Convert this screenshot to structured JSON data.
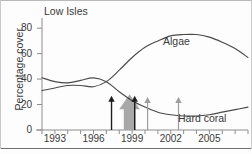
{
  "chart_data": {
    "type": "line",
    "title": "Low Isles",
    "xlabel": "",
    "ylabel": "Percentage cover",
    "xlim": [
      1992,
      2008
    ],
    "ylim": [
      0,
      88
    ],
    "grid": false,
    "legend_position": "inline-annotations",
    "xticks": [
      1993,
      1996,
      1999,
      2002,
      2005
    ],
    "xtick_labels": [
      "1993",
      "1996",
      "1999",
      "2002",
      "2005"
    ],
    "yticks": [
      0,
      20,
      40,
      60,
      80
    ],
    "ytick_labels": [
      "0",
      "20",
      "40",
      "60",
      "80"
    ],
    "series": [
      {
        "name": "Algae",
        "label": "Algae",
        "color": "#4a4a4a",
        "x": [
          1992.0,
          1993.0,
          1994.0,
          1995.0,
          1996.0,
          1997.0,
          1998.0,
          1999.0,
          2000.0,
          2001.0,
          2002.0,
          2003.0,
          2004.0,
          2005.0,
          2006.0,
          2007.0,
          2008.0
        ],
        "values": [
          31,
          33,
          35,
          35,
          34,
          38,
          47,
          57,
          65,
          70,
          74,
          75,
          75,
          73,
          69,
          64,
          57
        ]
      },
      {
        "name": "Hard coral",
        "label": "Hard coral",
        "color": "#4a4a4a",
        "x": [
          1992.0,
          1993.0,
          1994.0,
          1995.0,
          1996.0,
          1997.0,
          1998.0,
          1999.0,
          2000.0,
          2001.0,
          2002.0,
          2003.0,
          2004.0,
          2005.0,
          2006.0,
          2007.0,
          2008.0
        ],
        "values": [
          41,
          38,
          37,
          39,
          41,
          38,
          30,
          23,
          18,
          14,
          12,
          11,
          11,
          12,
          14,
          16,
          18
        ]
      }
    ],
    "annotations": [
      {
        "kind": "arrow",
        "name": "disturbance-arrow-1",
        "style": "dark",
        "x": 1997.4,
        "y_from": 0,
        "y_to": 27
      },
      {
        "kind": "block-arrow",
        "name": "bleaching-block-arrow",
        "style": "grey-block",
        "x_from": 1998.0,
        "x_to": 1999.6,
        "y_from": 0,
        "y_to": 28
      },
      {
        "kind": "arrow",
        "name": "disturbance-arrow-2",
        "style": "dark",
        "x": 1999.2,
        "y_from": 0,
        "y_to": 27
      },
      {
        "kind": "arrow",
        "name": "disturbance-arrow-3",
        "style": "light",
        "x": 2000.2,
        "y_from": 0,
        "y_to": 26
      },
      {
        "kind": "arrow",
        "name": "disturbance-arrow-4",
        "style": "light",
        "x": 2002.6,
        "y_from": 0,
        "y_to": 26
      }
    ]
  },
  "figure": {
    "title": "Low Isles",
    "y_axis_label": "Percentage cover",
    "ytick_labels": [
      "80",
      "60",
      "40",
      "20",
      "0"
    ],
    "xtick_labels": [
      "1993",
      "1996",
      "1999",
      "2002",
      "2005"
    ],
    "algae_label": "Algae",
    "coral_label": "Hard coral",
    "colors": {
      "curve": "#4a4a4a",
      "axis": "#8d8d8d",
      "arrow_dark": "#1d1d1d",
      "arrow_light": "#9d9d9d",
      "block_arrow": "#a8a8a8",
      "text": "#3a3a3a",
      "background": "#fdfdfd"
    }
  }
}
